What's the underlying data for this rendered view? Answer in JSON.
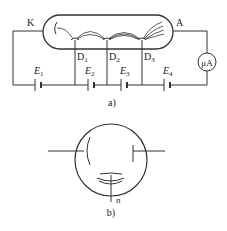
{
  "figure_a": {
    "caption": "a)",
    "cathode_label": "K",
    "anode_label": "A",
    "dynodes": [
      {
        "label": "D",
        "sub": "1"
      },
      {
        "label": "D",
        "sub": "2"
      },
      {
        "label": "D",
        "sub": "3"
      }
    ],
    "batteries": [
      {
        "label": "E",
        "sub": "1"
      },
      {
        "label": "E",
        "sub": "2"
      },
      {
        "label": "E",
        "sub": "3"
      },
      {
        "label": "E",
        "sub": "4"
      }
    ],
    "meter_label": "μA"
  },
  "figure_b": {
    "caption": "b)",
    "lead_label": "n"
  },
  "colors": {
    "line": "#333333",
    "background": "#ffffff"
  }
}
